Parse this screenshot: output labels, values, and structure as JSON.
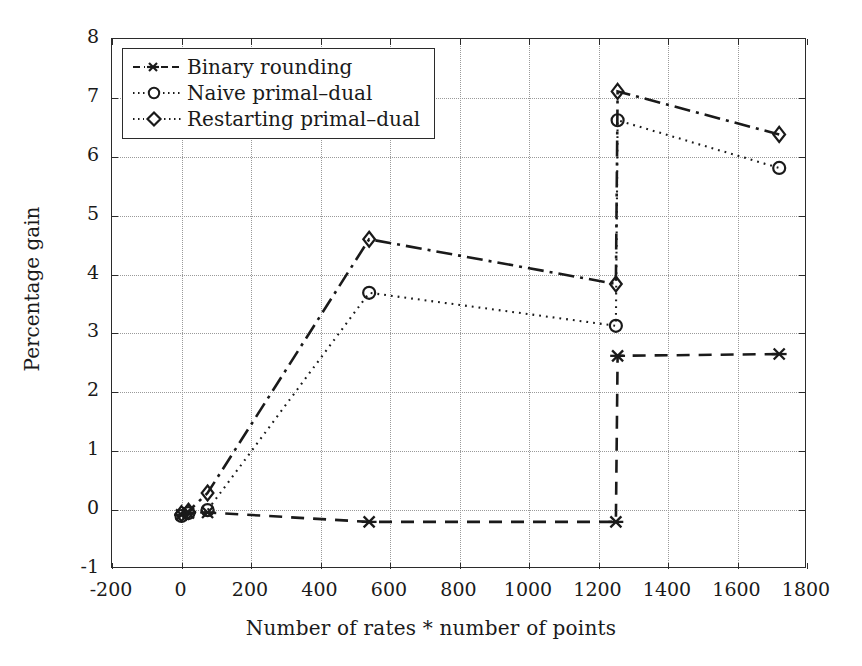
{
  "chart_data": {
    "type": "line",
    "title": "",
    "xlabel": "Number of rates * number of points",
    "ylabel": "Percentage gain",
    "xlim": [
      -200,
      1800
    ],
    "ylim": [
      -1,
      8
    ],
    "xticks": [
      -200,
      0,
      200,
      400,
      600,
      800,
      1000,
      1200,
      1400,
      1600,
      1800
    ],
    "yticks": [
      -1,
      0,
      1,
      2,
      3,
      4,
      5,
      6,
      7,
      8
    ],
    "grid": true,
    "legend_position": "upper left",
    "series": [
      {
        "name": "Binary rounding",
        "marker": "x",
        "linestyle": "dashed",
        "color": "#1a1a1a",
        "x": [
          0,
          20,
          75,
          540,
          1250,
          1255,
          1720
        ],
        "y": [
          -0.08,
          -0.05,
          -0.04,
          -0.2,
          -0.2,
          2.62,
          2.65
        ]
      },
      {
        "name": "Naive primal-dual",
        "marker": "o",
        "linestyle": "dotted",
        "color": "#1a1a1a",
        "x": [
          0,
          20,
          75,
          540,
          1250,
          1255,
          1720
        ],
        "y": [
          -0.1,
          -0.05,
          0.0,
          3.69,
          3.13,
          6.62,
          5.81
        ]
      },
      {
        "name": "Restarting primal-dual",
        "marker": "d",
        "linestyle": "dashdot",
        "color": "#1a1a1a",
        "x": [
          0,
          20,
          75,
          540,
          1250,
          1255,
          1720
        ],
        "y": [
          -0.06,
          -0.02,
          0.29,
          4.6,
          3.84,
          7.11,
          6.38
        ]
      }
    ]
  },
  "legend": {
    "items": [
      {
        "label": "Binary rounding"
      },
      {
        "label": "Naive primal–dual"
      },
      {
        "label": "Restarting primal–dual"
      }
    ]
  },
  "axis_titles": {
    "x": "Number of rates * number of points",
    "y": "Percentage gain"
  }
}
